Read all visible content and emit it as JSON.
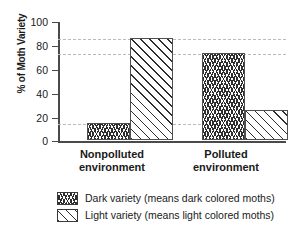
{
  "chart_data": {
    "type": "bar",
    "title": "",
    "xlabel": "",
    "ylabel": "% of Moth Variety",
    "ylim": [
      0,
      100
    ],
    "yticks": [
      0,
      20,
      40,
      60,
      80,
      100
    ],
    "grid": true,
    "gridline_values": [
      86,
      73,
      14
    ],
    "legend_position": "bottom",
    "categories": [
      "Nonpolluted environment",
      "Polluted environment"
    ],
    "series": [
      {
        "name": "Dark variety (means dark colored moths)",
        "pattern": "zigzag-vertical-hatch",
        "values": [
          14,
          73
        ]
      },
      {
        "name": "Light variety (means light colored moths)",
        "pattern": "diagonal-stripes",
        "values": [
          86,
          25
        ]
      }
    ]
  },
  "axis": {
    "y_title": "% of Moth Variety",
    "tick_labels": [
      "100",
      "80",
      "60",
      "40",
      "20",
      "0"
    ]
  },
  "categories": [
    {
      "line1": "Nonpolluted",
      "line2": "environment"
    },
    {
      "line1": "Polluted",
      "line2": "environment"
    }
  ],
  "legend": {
    "items": [
      {
        "label": "Dark variety (means dark colored moths)",
        "swatch": "zigzag-hatch-swatch"
      },
      {
        "label": "Light variety (means light colored moths)",
        "swatch": "diagonal-hatch-swatch"
      }
    ]
  },
  "colors": {
    "axis": "#4a4a4a",
    "grid": "#b9b9b9",
    "hatch": "#2d2d2d",
    "background": "#ffffff"
  }
}
